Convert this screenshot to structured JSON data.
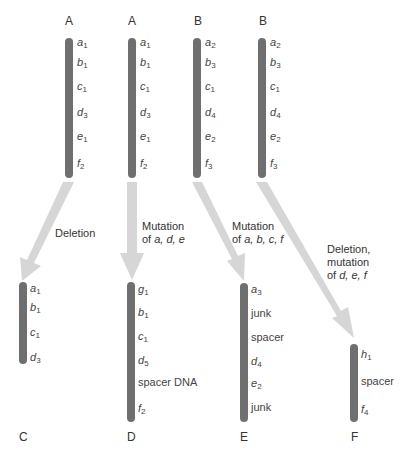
{
  "colors": {
    "chromosome": "#6f6f6f",
    "arrow": "#d6d6d6",
    "text": "#333333"
  },
  "top_chromosomes": [
    {
      "label": "A",
      "genes": [
        [
          "a",
          "1"
        ],
        [
          "b",
          "1"
        ],
        [
          "c",
          "1"
        ],
        [
          "d",
          "3"
        ],
        [
          "e",
          "1"
        ],
        [
          "f",
          "2"
        ]
      ]
    },
    {
      "label": "A",
      "genes": [
        [
          "a",
          "1"
        ],
        [
          "b",
          "1"
        ],
        [
          "c",
          "1"
        ],
        [
          "d",
          "3"
        ],
        [
          "e",
          "1"
        ],
        [
          "f",
          "2"
        ]
      ]
    },
    {
      "label": "B",
      "genes": [
        [
          "a",
          "2"
        ],
        [
          "b",
          "3"
        ],
        [
          "c",
          "1"
        ],
        [
          "d",
          "4"
        ],
        [
          "e",
          "2"
        ],
        [
          "f",
          "3"
        ]
      ]
    },
    {
      "label": "B",
      "genes": [
        [
          "a",
          "2"
        ],
        [
          "b",
          "3"
        ],
        [
          "c",
          "1"
        ],
        [
          "d",
          "4"
        ],
        [
          "e",
          "2"
        ],
        [
          "f",
          "3"
        ]
      ]
    }
  ],
  "transitions": [
    {
      "caption_line1": "Deletion",
      "caption_line2": "",
      "caption_line3": ""
    },
    {
      "caption_line1": "Mutation",
      "caption_line2_prefix": "of ",
      "caption_line2_vars": "a, d, e"
    },
    {
      "caption_line1": "Mutation",
      "caption_line2_prefix": "of ",
      "caption_line2_vars": "a, b, c, f"
    },
    {
      "caption_line1": "Deletion,",
      "caption_line2": "mutation",
      "caption_line3_prefix": "of ",
      "caption_line3_vars": "d, e, f"
    }
  ],
  "bottom_chromosomes": [
    {
      "label": "C",
      "genes": [
        [
          "a",
          "1",
          true
        ],
        [
          "b",
          "1",
          true
        ],
        [
          "c",
          "1",
          true
        ],
        [
          "d",
          "3",
          true
        ]
      ]
    },
    {
      "label": "D",
      "genes": [
        [
          "g",
          "1",
          true
        ],
        [
          "b",
          "1",
          true
        ],
        [
          "c",
          "1",
          true
        ],
        [
          "d",
          "5",
          true
        ],
        [
          "spacer DNA",
          "",
          false
        ],
        [
          "f",
          "2",
          true
        ]
      ]
    },
    {
      "label": "E",
      "genes": [
        [
          "a",
          "3",
          true
        ],
        [
          "junk",
          "",
          false
        ],
        [
          "spacer",
          "",
          false
        ],
        [
          "d",
          "4",
          true
        ],
        [
          "e",
          "2",
          true
        ],
        [
          "junk",
          "",
          false
        ]
      ]
    },
    {
      "label": "F",
      "genes": [
        [
          "h",
          "1",
          true
        ],
        [
          "spacer",
          "",
          false
        ],
        [
          "f",
          "4",
          true
        ]
      ]
    }
  ]
}
